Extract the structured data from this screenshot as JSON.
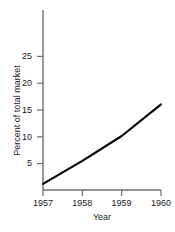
{
  "chart_data": {
    "type": "line",
    "title": "",
    "xlabel": "Year",
    "ylabel": "Percent of total market",
    "x": [
      1957,
      1958,
      1959,
      1960
    ],
    "values": [
      1.0,
      4.7,
      8.7,
      13.8
    ],
    "series": [
      {
        "name": "Percent of total market",
        "values": [
          1.0,
          4.7,
          8.7,
          13.8
        ]
      }
    ],
    "xlim": [
      1957,
      1960
    ],
    "ylim": [
      0,
      29
    ],
    "xticks": [
      1957,
      1958,
      1959,
      1960
    ],
    "xtick_labels": [
      "1957",
      "1958",
      "1959",
      "1960"
    ],
    "yticks": [
      5,
      10,
      15,
      20,
      25
    ],
    "ytick_labels": [
      "5",
      "10",
      "15",
      "20",
      "25"
    ],
    "grid": false,
    "legend": "none",
    "line_color": "#000000",
    "axis_color": "#6e6e6e",
    "background_color": "#ffffff"
  }
}
